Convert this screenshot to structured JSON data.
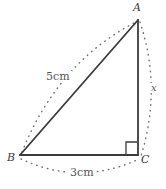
{
  "figure": {
    "type": "right-triangle-geometry-diagram",
    "background_color": "#ffffff",
    "stroke_color": "#3b3b3b",
    "arc_color": "#6e6e6e",
    "text_color": "#555555",
    "vertices": [
      {
        "name": "A",
        "label": "A",
        "x": 138,
        "y": 20
      },
      {
        "name": "B",
        "label": "B",
        "x": 20,
        "y": 155
      },
      {
        "name": "C",
        "label": "C",
        "x": 138,
        "y": 155
      }
    ],
    "sides": [
      {
        "name": "hypotenuse-ab",
        "from": "B",
        "to": "A",
        "label": "5cm",
        "style": "solid"
      },
      {
        "name": "base-bc",
        "from": "B",
        "to": "C",
        "label": "3cm",
        "style": "solid"
      },
      {
        "name": "vertical-ac",
        "from": "A",
        "to": "C",
        "label": "x",
        "style": "solid"
      }
    ],
    "right_angle": {
      "at_vertex": "C",
      "marker": "square",
      "size": 12
    },
    "dimension_arcs": [
      {
        "name": "arc-ab",
        "from": "B",
        "to": "A",
        "bows": "outward-left",
        "label": "5cm"
      },
      {
        "name": "arc-bc",
        "from": "B",
        "to": "C",
        "bows": "downward",
        "label": "3cm"
      },
      {
        "name": "arc-ac",
        "from": "A",
        "to": "C",
        "bows": "outward-right",
        "label": "x"
      }
    ],
    "labels": {
      "vertex_a": "A",
      "vertex_b": "B",
      "vertex_c": "C",
      "side_ab": "5cm",
      "side_bc": "3cm",
      "side_ac": "x"
    }
  }
}
